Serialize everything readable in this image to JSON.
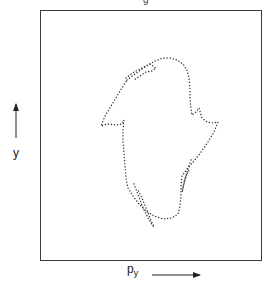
{
  "figure": {
    "title_fragment": "g",
    "x_axis_label": "p",
    "x_axis_subscript": "y",
    "y_axis_label": "y",
    "x_arrow": "right-arrow",
    "y_arrow": "up-arrow",
    "curve_style": "dotted",
    "frame_color": "#3a3a3a",
    "dot_color": "#333333"
  },
  "chart_data": {
    "type": "scatter",
    "title": "",
    "xlabel": "p_y",
    "ylabel": "y",
    "grid": false,
    "series": [
      {
        "name": "outer-contour",
        "points_px": [
          [
            127,
            80
          ],
          [
            135,
            74
          ],
          [
            145,
            67
          ],
          [
            155,
            61
          ],
          [
            163,
            58
          ],
          [
            170,
            58
          ],
          [
            177,
            60
          ],
          [
            183,
            64
          ],
          [
            187,
            70
          ],
          [
            189,
            78
          ],
          [
            190,
            88
          ],
          [
            190,
            98
          ],
          [
            191,
            108
          ],
          [
            192,
            115
          ],
          [
            196,
            112
          ],
          [
            199,
            108
          ],
          [
            202,
            118
          ],
          [
            207,
            122
          ],
          [
            213,
            123
          ],
          [
            218,
            122
          ],
          [
            214,
            132
          ],
          [
            208,
            142
          ],
          [
            201,
            152
          ],
          [
            194,
            161
          ],
          [
            187,
            169
          ],
          [
            182,
            176
          ],
          [
            181,
            186
          ],
          [
            181,
            196
          ],
          [
            180,
            206
          ],
          [
            178,
            214
          ],
          [
            172,
            218
          ],
          [
            163,
            219
          ],
          [
            154,
            216
          ],
          [
            146,
            211
          ],
          [
            139,
            204
          ],
          [
            133,
            196
          ],
          [
            128,
            188
          ],
          [
            126,
            178
          ],
          [
            125,
            166
          ],
          [
            124,
            154
          ],
          [
            123,
            142
          ],
          [
            123,
            130
          ],
          [
            124,
            120
          ],
          [
            122,
            124
          ],
          [
            116,
            125
          ],
          [
            108,
            124
          ],
          [
            101,
            126
          ],
          [
            105,
            116
          ],
          [
            111,
            106
          ],
          [
            117,
            96
          ],
          [
            122,
            88
          ],
          [
            127,
            80
          ]
        ]
      },
      {
        "name": "upper-filament",
        "points_px": [
          [
            126,
            78
          ],
          [
            134,
            72
          ],
          [
            142,
            68
          ],
          [
            150,
            64
          ],
          [
            156,
            68
          ],
          [
            152,
            71
          ],
          [
            146,
            72
          ],
          [
            140,
            76
          ],
          [
            134,
            80
          ]
        ]
      },
      {
        "name": "lower-filament",
        "points_px": [
          [
            134,
            184
          ],
          [
            137,
            192
          ],
          [
            140,
            200
          ],
          [
            143,
            208
          ],
          [
            147,
            216
          ],
          [
            151,
            223
          ],
          [
            154,
            227
          ],
          [
            150,
            218
          ],
          [
            146,
            208
          ],
          [
            142,
            198
          ],
          [
            138,
            190
          ]
        ]
      },
      {
        "name": "inner-right-filament",
        "points_px": [
          [
            191,
            160
          ],
          [
            188,
            168
          ],
          [
            186,
            176
          ],
          [
            184,
            184
          ],
          [
            182,
            192
          ],
          [
            185,
            178
          ],
          [
            189,
            170
          ]
        ]
      }
    ]
  }
}
